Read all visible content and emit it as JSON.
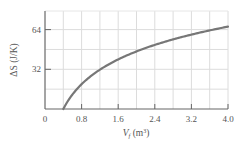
{
  "chart_data": {
    "type": "line",
    "title": "",
    "xlabel": "V_f (m³)",
    "xlabel_main": "V",
    "xlabel_sub": "f",
    "xlabel_unit": "(m",
    "xlabel_sup": "3",
    "xlabel_close": ")",
    "ylabel": "ΔS (J/K)",
    "xlim": [
      0,
      4.0
    ],
    "ylim": [
      0,
      79
    ],
    "x_ticks": [
      0,
      0.8,
      1.6,
      2.4,
      3.2,
      4.0
    ],
    "x_tick_labels": [
      "0",
      "0.8",
      "1.6",
      "2.4",
      "3.2",
      "4.0"
    ],
    "y_ticks": [
      32,
      64
    ],
    "y_tick_labels": [
      "32",
      "64"
    ],
    "x_grid_step": 0.4,
    "y_grid_step": 16,
    "grid": true,
    "legend": null,
    "series": [
      {
        "name": "ΔS",
        "color": "#777777",
        "x": [
          0.4,
          0.5,
          0.6,
          0.8,
          1.0,
          1.2,
          1.6,
          2.0,
          2.4,
          2.8,
          3.2,
          3.6,
          4.0
        ],
        "values": [
          0,
          6.4,
          11.7,
          20.0,
          26.4,
          31.6,
          39.9,
          46.4,
          51.6,
          56.1,
          59.9,
          63.3,
          66.4
        ]
      }
    ]
  }
}
